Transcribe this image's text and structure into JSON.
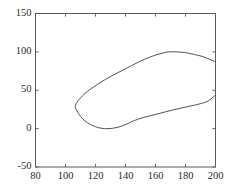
{
  "figure": {
    "background_color": "#ffffff",
    "frame_color": "#5a5a5a",
    "curve_color": "#4a4a4a",
    "tick_label_color": "#2b2b2b"
  },
  "chart_data": {
    "type": "line",
    "title": "",
    "subtitle": "",
    "xlabel": "",
    "ylabel": "",
    "xlim": [
      80,
      200
    ],
    "ylim": [
      -50,
      150
    ],
    "xticks": [
      80,
      100,
      120,
      140,
      160,
      180,
      200
    ],
    "yticks": [
      -50,
      0,
      50,
      100,
      150
    ],
    "xtick_labels": [
      "80",
      "100",
      "120",
      "140",
      "160",
      "180",
      "200"
    ],
    "ytick_labels": [
      "-50",
      "0",
      "50",
      "100",
      "150"
    ],
    "grid": false,
    "legend": null,
    "annotations": [],
    "series": [
      {
        "name": "upper-branch",
        "comment": "open curve rising from nose to peak then descending to right edge",
        "x": [
          108.0,
          106.5,
          107.5,
          110.0,
          113.0,
          117.0,
          121.5,
          126.5,
          132.0,
          138.0,
          144.0,
          150.0,
          156.0,
          161.0,
          165.0,
          169.0,
          174.0,
          180.0,
          186.0,
          192.0,
          200.0
        ],
        "y": [
          22.0,
          28.0,
          34.0,
          40.0,
          46.0,
          52.0,
          58.0,
          64.0,
          70.0,
          76.0,
          82.0,
          88.0,
          93.0,
          96.5,
          98.5,
          100.0,
          100.0,
          99.0,
          96.5,
          93.5,
          87.0
        ]
      },
      {
        "name": "lower-branch",
        "comment": "curve from nose down across bottom then rising to right edge",
        "x": [
          108.0,
          110.0,
          113.0,
          116.5,
          120.0,
          123.0,
          126.0,
          129.0,
          132.0,
          135.0,
          138.0,
          141.0,
          144.0,
          148.0,
          153.0,
          159.0,
          166.0,
          173.0,
          181.0,
          189.0,
          195.0,
          200.0
        ],
        "y": [
          22.0,
          16.0,
          10.0,
          5.5,
          2.5,
          0.8,
          0.0,
          0.0,
          0.6,
          1.8,
          3.6,
          6.0,
          9.0,
          12.0,
          15.0,
          18.0,
          21.5,
          25.0,
          28.5,
          32.0,
          36.0,
          44.0
        ]
      }
    ]
  },
  "axes": {
    "frame_visible": true,
    "ticks_direction": "in"
  }
}
